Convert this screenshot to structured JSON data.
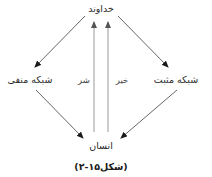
{
  "diagram": {
    "nodes": {
      "top": {
        "label": "خداوند"
      },
      "left": {
        "label": "شبکه منفی"
      },
      "right": {
        "label": "شبکه مثبت"
      },
      "bottom": {
        "label": "انسان"
      }
    },
    "edge_labels": {
      "evil": "شر",
      "good": "خیر"
    },
    "edges": [
      {
        "from": "top",
        "to": "left"
      },
      {
        "from": "top",
        "to": "right"
      },
      {
        "from": "left",
        "to": "bottom"
      },
      {
        "from": "right",
        "to": "bottom"
      },
      {
        "from": "bottom",
        "to": "top",
        "label": "شر"
      },
      {
        "from": "bottom",
        "to": "top",
        "label": "خیر"
      }
    ],
    "caption": "(شکل۱۵-۲)",
    "colors": {
      "diagonal_line": "#555555",
      "vertical_line": "#9a9a9a",
      "arrowhead": "#1a1a1a",
      "text": "#2a2a2a"
    }
  }
}
